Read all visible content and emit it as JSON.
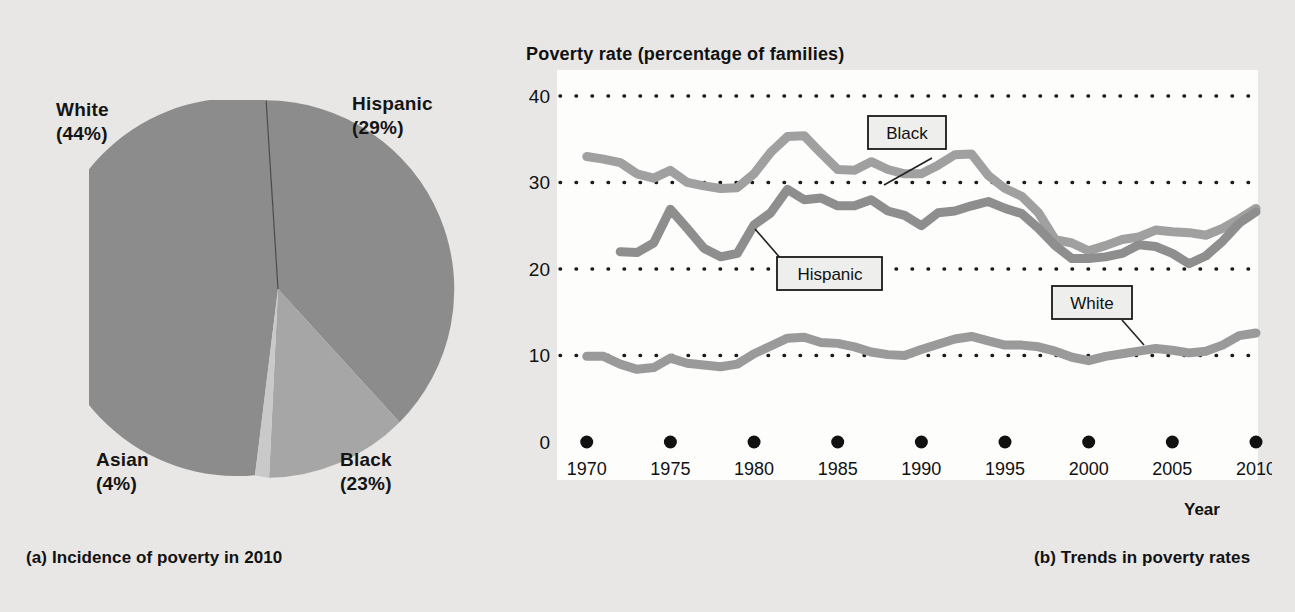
{
  "figure": {
    "panel_a": {
      "caption": "(a) Incidence of poverty in 2010",
      "labels": {
        "white": "White\n(44%)",
        "hispanic": "Hispanic\n(29%)",
        "asian": "Asian\n(4%)",
        "black": "Black\n(23%)"
      }
    },
    "panel_b": {
      "caption": "(b) Trends in poverty rates",
      "axis_title": "Poverty rate (percentage of families)",
      "xaxis_title": "Year",
      "series_labels": {
        "black": "Black",
        "hispanic": "Hispanic",
        "white": "White"
      }
    }
  },
  "colors": {
    "page_background": "#e8e7e5",
    "plot_background": "#fdfdfc",
    "pie_white_slice": "#8c8c8c",
    "pie_hispanic_slice": "#8c8c8c",
    "pie_black_slice": "#a6a6a6",
    "pie_asian_slice": "#c9c9c9",
    "line_black": "#a0a0a0",
    "line_hispanic": "#8e8e8e",
    "line_white": "#9a9a9a",
    "gridline": "#1a1a1a",
    "text": "#121212"
  },
  "chart_data": [
    {
      "type": "pie",
      "title": "(a) Incidence of poverty in 2010",
      "labels": [
        "Hispanic",
        "Black",
        "Asian",
        "White"
      ],
      "values": [
        29,
        23,
        4,
        44
      ],
      "value_unit": "percent",
      "legend": "outside-labels",
      "start_angle_deg": -3,
      "slice_colors": [
        "#8c8c8c",
        "#a6a6a6",
        "#c9c9c9",
        "#8c8c8c"
      ]
    },
    {
      "type": "line",
      "title": "Poverty rate (percentage of families)",
      "xlabel": "Year",
      "ylabel": "Poverty rate (percentage of families)",
      "xlim": [
        1969,
        2010
      ],
      "ylim": [
        0,
        43
      ],
      "yticks": [
        0,
        10,
        20,
        30,
        40
      ],
      "xticks": [
        1970,
        1975,
        1980,
        1985,
        1990,
        1995,
        2000,
        2005,
        2010
      ],
      "grid": "horizontal-dotted",
      "legend": "inline-boxed-labels",
      "series": [
        {
          "name": "Black",
          "color": "#a0a0a0",
          "x": [
            1970,
            1971,
            1972,
            1973,
            1974,
            1975,
            1976,
            1977,
            1978,
            1979,
            1980,
            1981,
            1982,
            1983,
            1984,
            1985,
            1986,
            1987,
            1988,
            1989,
            1990,
            1991,
            1992,
            1993,
            1994,
            1995,
            1996,
            1997,
            1998,
            1999,
            2000,
            2001,
            2002,
            2003,
            2004,
            2005,
            2006,
            2007,
            2008,
            2009,
            2010
          ],
          "values": [
            33.0,
            32.7,
            32.3,
            31.0,
            30.5,
            31.4,
            30.0,
            29.6,
            29.3,
            29.4,
            31.0,
            33.5,
            35.3,
            35.4,
            33.4,
            31.5,
            31.4,
            32.4,
            31.5,
            31.0,
            31.0,
            32.0,
            33.2,
            33.3,
            30.8,
            29.3,
            28.4,
            26.5,
            23.4,
            23.0,
            22.1,
            22.7,
            23.4,
            23.7,
            24.5,
            24.3,
            24.2,
            23.9,
            24.7,
            25.8,
            27.0
          ]
        },
        {
          "name": "Hispanic",
          "color": "#8e8e8e",
          "x": [
            1972,
            1973,
            1974,
            1975,
            1976,
            1977,
            1978,
            1979,
            1980,
            1981,
            1982,
            1983,
            1984,
            1985,
            1986,
            1987,
            1988,
            1989,
            1990,
            1991,
            1992,
            1993,
            1994,
            1995,
            1996,
            1997,
            1998,
            1999,
            2000,
            2001,
            2002,
            2003,
            2004,
            2005,
            2006,
            2007,
            2008,
            2009,
            2010
          ],
          "values": [
            22.0,
            21.9,
            23.0,
            26.9,
            24.7,
            22.4,
            21.4,
            21.8,
            25.1,
            26.5,
            29.2,
            28.0,
            28.2,
            27.3,
            27.3,
            28.0,
            26.7,
            26.2,
            25.0,
            26.5,
            26.7,
            27.3,
            27.8,
            27.0,
            26.4,
            24.7,
            22.7,
            21.2,
            21.2,
            21.4,
            21.8,
            22.8,
            22.6,
            21.8,
            20.6,
            21.5,
            23.2,
            25.3,
            26.6
          ]
        },
        {
          "name": "White",
          "color": "#9a9a9a",
          "x": [
            1970,
            1971,
            1972,
            1973,
            1974,
            1975,
            1976,
            1977,
            1978,
            1979,
            1980,
            1981,
            1982,
            1983,
            1984,
            1985,
            1986,
            1987,
            1988,
            1989,
            1990,
            1991,
            1992,
            1993,
            1994,
            1995,
            1996,
            1997,
            1998,
            1999,
            2000,
            2001,
            2002,
            2003,
            2004,
            2005,
            2006,
            2007,
            2008,
            2009,
            2010
          ],
          "values": [
            9.9,
            9.9,
            9.0,
            8.4,
            8.6,
            9.7,
            9.1,
            8.9,
            8.7,
            9.0,
            10.2,
            11.1,
            12.0,
            12.1,
            11.5,
            11.4,
            11.0,
            10.4,
            10.1,
            10.0,
            10.7,
            11.3,
            11.9,
            12.2,
            11.7,
            11.2,
            11.2,
            11.0,
            10.5,
            9.8,
            9.4,
            9.9,
            10.2,
            10.5,
            10.8,
            10.6,
            10.3,
            10.5,
            11.2,
            12.3,
            12.6
          ]
        }
      ]
    }
  ]
}
